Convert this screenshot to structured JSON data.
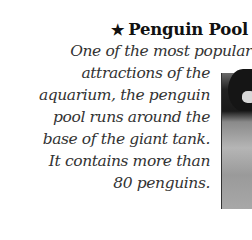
{
  "section": {
    "star_icon": "★",
    "title": "Penguin Pool",
    "body_lines": [
      "One of the most popular",
      "attractions of the",
      "aquarium, the penguin",
      "pool runs around the",
      "base of the giant tank.",
      "It contains more than",
      "80 penguins."
    ]
  },
  "photo": {
    "subject": "penguin photograph (grayscale, cropped)"
  }
}
